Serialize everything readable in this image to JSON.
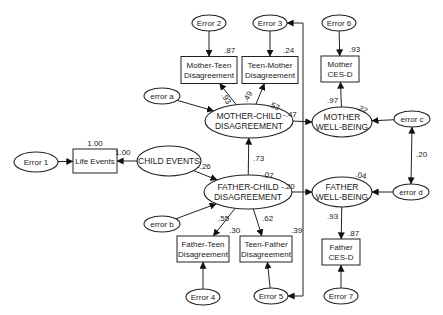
{
  "diagram": {
    "type": "structural-equation-model",
    "nodes": {
      "error1": {
        "label": [
          "Error 1"
        ],
        "kind": "error"
      },
      "life_events": {
        "label": [
          "Life Events"
        ],
        "kind": "observed",
        "r2": "1.00"
      },
      "child_events": {
        "label": [
          "CHILD EVENTS"
        ],
        "kind": "latent"
      },
      "error_a": {
        "label": [
          "error a"
        ],
        "kind": "error"
      },
      "error_b": {
        "label": [
          "error b"
        ],
        "kind": "error"
      },
      "error_c": {
        "label": [
          "error c"
        ],
        "kind": "error"
      },
      "error_d": {
        "label": [
          "error d"
        ],
        "kind": "error"
      },
      "error2": {
        "label": [
          "Error 2"
        ],
        "kind": "error"
      },
      "error3": {
        "label": [
          "Error 3"
        ],
        "kind": "error"
      },
      "error4": {
        "label": [
          "Error 4"
        ],
        "kind": "error"
      },
      "error5": {
        "label": [
          "Error 5"
        ],
        "kind": "error"
      },
      "error6": {
        "label": [
          "Error 6"
        ],
        "kind": "error"
      },
      "error7": {
        "label": [
          "Error 7"
        ],
        "kind": "error"
      },
      "mother_teen": {
        "label": [
          "Mother-Teen",
          "Disagreement"
        ],
        "kind": "observed",
        "r2": ".87"
      },
      "teen_mother": {
        "label": [
          "Teen-Mother",
          "Disagreement"
        ],
        "kind": "observed",
        "r2": ".24"
      },
      "father_teen": {
        "label": [
          "Father-Teen",
          "Disagreement"
        ],
        "kind": "observed",
        "r2": ".30"
      },
      "teen_father": {
        "label": [
          "Teen-Father",
          "Disagreement"
        ],
        "kind": "observed",
        "r2": ".39"
      },
      "mother_cesd": {
        "label": [
          "Mother",
          "CES-D"
        ],
        "kind": "observed",
        "r2": ".93"
      },
      "father_cesd": {
        "label": [
          "Father",
          "CES-D"
        ],
        "kind": "observed",
        "r2": ".87"
      },
      "mother_child": {
        "label": [
          "MOTHER-CHILD",
          "DISAGREEMENT"
        ],
        "kind": "latent",
        "r2": ".53"
      },
      "father_child": {
        "label": [
          "FATHER-CHILD",
          "DISAGREEMENT"
        ],
        "kind": "latent",
        "r2": ".07"
      },
      "mother_wb": {
        "label": [
          "MOTHER",
          "WELL-BEING"
        ],
        "kind": "latent",
        "r2": ".22"
      },
      "father_wb": {
        "label": [
          "FATHER",
          "WELL-BEING"
        ],
        "kind": "latent",
        "r2": ".04"
      }
    },
    "paths": [
      {
        "from": "error1",
        "to": "life_events",
        "coef": ""
      },
      {
        "from": "child_events",
        "to": "life_events",
        "coef": "1.00"
      },
      {
        "from": "child_events",
        "to": "father_child",
        "coef": "-.26"
      },
      {
        "from": "father_child",
        "to": "mother_child",
        "coef": ".73"
      },
      {
        "from": "error_a",
        "to": "mother_child",
        "coef": ""
      },
      {
        "from": "error_b",
        "to": "father_child",
        "coef": ""
      },
      {
        "from": "mother_child",
        "to": "mother_teen",
        "coef": ".93"
      },
      {
        "from": "mother_child",
        "to": "teen_mother",
        "coef": ".49"
      },
      {
        "from": "mother_child",
        "to": "mother_wb",
        "coef": "-.47"
      },
      {
        "from": "father_child",
        "to": "father_teen",
        "coef": ".55"
      },
      {
        "from": "father_child",
        "to": "teen_father",
        "coef": ".62"
      },
      {
        "from": "father_child",
        "to": "father_wb",
        "coef": "-.20"
      },
      {
        "from": "error2",
        "to": "mother_teen",
        "coef": ""
      },
      {
        "from": "error3",
        "to": "teen_mother",
        "coef": ""
      },
      {
        "from": "error4",
        "to": "father_teen",
        "coef": ""
      },
      {
        "from": "error5",
        "to": "teen_father",
        "coef": ""
      },
      {
        "from": "error3",
        "to": "error5",
        "coef": "",
        "kind": "covariance"
      },
      {
        "from": "mother_wb",
        "to": "mother_cesd",
        "coef": ".97"
      },
      {
        "from": "father_wb",
        "to": "father_cesd",
        "coef": ".93"
      },
      {
        "from": "error6",
        "to": "mother_cesd",
        "coef": ""
      },
      {
        "from": "error7",
        "to": "father_cesd",
        "coef": ""
      },
      {
        "from": "error_c",
        "to": "mother_wb",
        "coef": ""
      },
      {
        "from": "error_d",
        "to": "father_wb",
        "coef": ""
      },
      {
        "from": "error_c",
        "to": "error_d",
        "coef": ".20",
        "kind": "covariance"
      }
    ]
  }
}
